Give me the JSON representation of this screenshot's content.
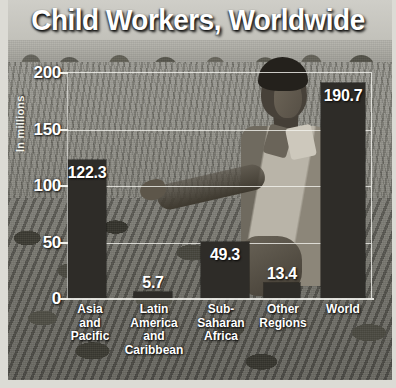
{
  "title": "Child Workers, Worldwide",
  "chart_data": {
    "type": "bar",
    "title": "Child Workers, Worldwide",
    "xlabel": "",
    "ylabel": "In millions",
    "ylim": [
      0,
      200
    ],
    "yticks": [
      "0",
      "50",
      "100",
      "150",
      "200"
    ],
    "grid": true,
    "legend": null,
    "categories": [
      "Asia and Pacific",
      "Latin America and Caribbean",
      "Sub-Saharan Africa",
      "Other Regions",
      "World"
    ],
    "category_lines": [
      [
        "Asia",
        "and",
        "Pacific"
      ],
      [
        "Latin",
        "America",
        "and",
        "Caribbean"
      ],
      [
        "Sub-",
        "Saharan",
        "Africa"
      ],
      [
        "Other",
        "Regions"
      ],
      [
        "World"
      ]
    ],
    "values": [
      122.3,
      5.7,
      49.3,
      13.4,
      190.7
    ],
    "value_labels": [
      "122.3",
      "5.7",
      "49.3",
      "13.4",
      "190.7"
    ],
    "bar_color": "#2e2c28",
    "grid_color": "#f5f5f0",
    "text_color": "#ffffff"
  },
  "background": {
    "description": "grayscale photograph of a child standing in a crop field",
    "style": "photo-backdrop"
  }
}
